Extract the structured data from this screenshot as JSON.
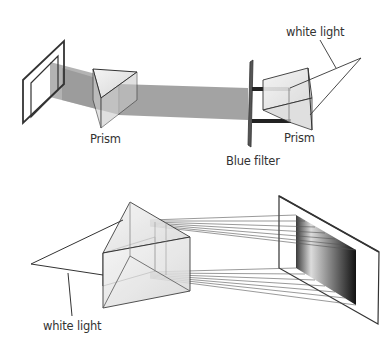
{
  "diagram": {
    "top_setup": {
      "labels": {
        "prism_left": "Prism",
        "prism_right": "Prism",
        "filter": "Blue filter",
        "white_light": "white light"
      }
    },
    "bottom_setup": {
      "labels": {
        "white_light": "white light"
      }
    },
    "colors": {
      "stroke": "#333333",
      "beam": "#8c8c8c",
      "prism_fill": "#e6e6e6",
      "background": "#ffffff"
    }
  }
}
